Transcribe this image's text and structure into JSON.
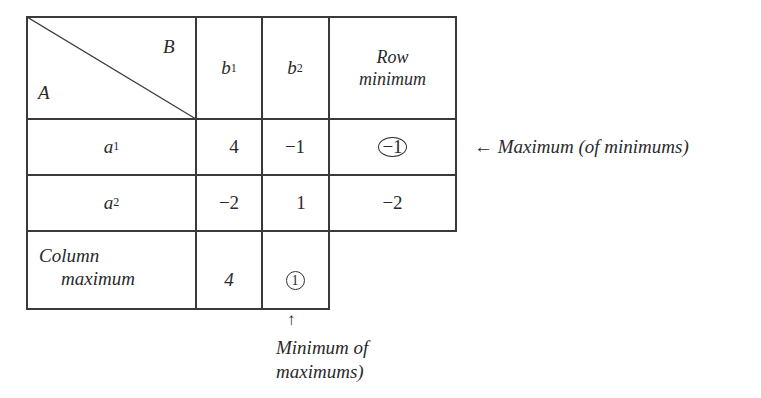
{
  "table": {
    "corner": {
      "row_player": "A",
      "col_player": "B"
    },
    "column_headers": [
      {
        "name": "b",
        "sub": "1"
      },
      {
        "name": "b",
        "sub": "2"
      }
    ],
    "row_min_header": [
      "Row",
      "minimum"
    ],
    "rows": [
      {
        "name": "a",
        "sub": "1",
        "values": [
          "4",
          "−1"
        ],
        "row_min": "−1",
        "row_min_circled": true
      },
      {
        "name": "a",
        "sub": "2",
        "values": [
          "−2",
          "1"
        ],
        "row_min": "−2",
        "row_min_circled": false
      }
    ],
    "col_max_label": [
      "Column",
      "maximum"
    ],
    "col_max_values": [
      "4",
      "1"
    ],
    "col_max_circled_index": 1
  },
  "annotations": {
    "right_arrow": "←",
    "right_text": "Maximum (of minimums)",
    "down_arrow": "↑",
    "bottom_text_line1": "Minimum of",
    "bottom_text_line2": "maximums)"
  }
}
